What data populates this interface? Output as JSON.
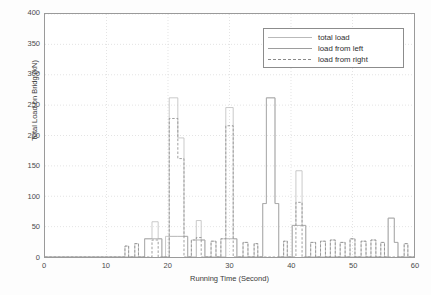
{
  "chart_data": {
    "type": "line",
    "title": "",
    "xlabel": "Running Time (Second)",
    "ylabel": "Total Load on Bridg (kN)",
    "xlim": [
      0,
      60
    ],
    "ylim": [
      0,
      400
    ],
    "xticks": [
      0,
      10,
      20,
      30,
      40,
      50,
      60
    ],
    "yticks": [
      0,
      50,
      100,
      150,
      200,
      250,
      300,
      350,
      400
    ],
    "grid": true,
    "legend_position": "upper-right",
    "legend": [
      {
        "label": "total load",
        "style": "solid",
        "color": "#b9b9b9"
      },
      {
        "label": "load from left",
        "style": "solid",
        "color": "#9d9d9d"
      },
      {
        "label": "load from right",
        "style": "dashed",
        "color": "#8a8a8a"
      }
    ],
    "series": [
      {
        "name": "total load",
        "style": "solid",
        "color": "#c0c0c0",
        "points": [
          [
            0,
            0
          ],
          [
            13.0,
            0
          ],
          [
            13.0,
            18
          ],
          [
            13.6,
            18
          ],
          [
            13.6,
            0
          ],
          [
            14.6,
            0
          ],
          [
            14.6,
            22
          ],
          [
            15.2,
            22
          ],
          [
            15.2,
            0
          ],
          [
            16.2,
            0
          ],
          [
            16.2,
            30
          ],
          [
            17.4,
            30
          ],
          [
            17.4,
            58
          ],
          [
            18.4,
            58
          ],
          [
            18.4,
            30
          ],
          [
            19.0,
            30
          ],
          [
            19.0,
            0
          ],
          [
            19.6,
            0
          ],
          [
            19.6,
            34
          ],
          [
            20.2,
            34
          ],
          [
            20.2,
            262
          ],
          [
            21.6,
            262
          ],
          [
            21.6,
            196
          ],
          [
            22.6,
            196
          ],
          [
            22.6,
            34
          ],
          [
            23.2,
            34
          ],
          [
            23.2,
            0
          ],
          [
            23.8,
            0
          ],
          [
            23.8,
            28
          ],
          [
            24.6,
            28
          ],
          [
            24.6,
            60
          ],
          [
            25.4,
            60
          ],
          [
            25.4,
            28
          ],
          [
            26.0,
            28
          ],
          [
            26.0,
            0
          ],
          [
            27.0,
            0
          ],
          [
            27.0,
            26
          ],
          [
            27.8,
            26
          ],
          [
            27.8,
            0
          ],
          [
            28.6,
            0
          ],
          [
            28.6,
            30
          ],
          [
            29.4,
            30
          ],
          [
            29.4,
            246
          ],
          [
            30.6,
            246
          ],
          [
            30.6,
            30
          ],
          [
            31.2,
            30
          ],
          [
            31.2,
            0
          ],
          [
            32.2,
            0
          ],
          [
            32.2,
            24
          ],
          [
            33.0,
            24
          ],
          [
            33.0,
            0
          ],
          [
            34.0,
            0
          ],
          [
            34.0,
            22
          ],
          [
            34.6,
            22
          ],
          [
            34.6,
            0
          ],
          [
            35.4,
            0
          ],
          [
            35.4,
            88
          ],
          [
            36.0,
            88
          ],
          [
            36.0,
            262
          ],
          [
            37.4,
            262
          ],
          [
            37.4,
            88
          ],
          [
            38.0,
            88
          ],
          [
            38.0,
            0
          ],
          [
            38.8,
            0
          ],
          [
            38.8,
            26
          ],
          [
            39.4,
            26
          ],
          [
            39.4,
            0
          ],
          [
            40.2,
            0
          ],
          [
            40.2,
            52
          ],
          [
            40.8,
            52
          ],
          [
            40.8,
            142
          ],
          [
            41.8,
            142
          ],
          [
            41.8,
            52
          ],
          [
            42.4,
            52
          ],
          [
            42.4,
            0
          ],
          [
            43.2,
            0
          ],
          [
            43.2,
            24
          ],
          [
            44.0,
            24
          ],
          [
            44.0,
            0
          ],
          [
            44.8,
            0
          ],
          [
            44.8,
            26
          ],
          [
            45.6,
            26
          ],
          [
            45.6,
            0
          ],
          [
            46.4,
            0
          ],
          [
            46.4,
            28
          ],
          [
            47.2,
            28
          ],
          [
            47.2,
            0
          ],
          [
            48.0,
            0
          ],
          [
            48.0,
            24
          ],
          [
            48.8,
            24
          ],
          [
            48.8,
            0
          ],
          [
            49.6,
            0
          ],
          [
            49.6,
            30
          ],
          [
            50.4,
            30
          ],
          [
            50.4,
            0
          ],
          [
            51.4,
            0
          ],
          [
            51.4,
            26
          ],
          [
            52.2,
            26
          ],
          [
            52.2,
            0
          ],
          [
            53.0,
            0
          ],
          [
            53.0,
            28
          ],
          [
            53.8,
            28
          ],
          [
            53.8,
            0
          ],
          [
            54.6,
            0
          ],
          [
            54.6,
            24
          ],
          [
            55.2,
            24
          ],
          [
            55.2,
            0
          ],
          [
            55.8,
            0
          ],
          [
            55.8,
            64
          ],
          [
            56.8,
            64
          ],
          [
            56.8,
            24
          ],
          [
            57.4,
            24
          ],
          [
            57.4,
            0
          ],
          [
            58.4,
            0
          ],
          [
            58.4,
            22
          ],
          [
            59.0,
            22
          ],
          [
            59.0,
            0
          ],
          [
            60,
            0
          ]
        ]
      },
      {
        "name": "load from left",
        "style": "solid",
        "color": "#a8a8a8",
        "points": [
          [
            0,
            0
          ],
          [
            16.2,
            0
          ],
          [
            16.2,
            30
          ],
          [
            17.4,
            30
          ],
          [
            17.4,
            30
          ],
          [
            18.4,
            30
          ],
          [
            18.4,
            30
          ],
          [
            19.0,
            30
          ],
          [
            19.0,
            0
          ],
          [
            20.2,
            0
          ],
          [
            20.2,
            34
          ],
          [
            21.6,
            34
          ],
          [
            21.6,
            34
          ],
          [
            22.6,
            34
          ],
          [
            22.6,
            34
          ],
          [
            23.2,
            34
          ],
          [
            23.2,
            0
          ],
          [
            24.6,
            0
          ],
          [
            24.6,
            28
          ],
          [
            25.4,
            28
          ],
          [
            25.4,
            28
          ],
          [
            26.0,
            28
          ],
          [
            26.0,
            0
          ],
          [
            29.4,
            0
          ],
          [
            29.4,
            30
          ],
          [
            30.6,
            30
          ],
          [
            30.6,
            30
          ],
          [
            31.2,
            30
          ],
          [
            31.2,
            0
          ],
          [
            35.4,
            0
          ],
          [
            35.4,
            88
          ],
          [
            36.0,
            88
          ],
          [
            36.0,
            262
          ],
          [
            37.4,
            262
          ],
          [
            37.4,
            88
          ],
          [
            38.0,
            88
          ],
          [
            38.0,
            0
          ],
          [
            40.2,
            0
          ],
          [
            40.2,
            52
          ],
          [
            40.8,
            52
          ],
          [
            40.8,
            52
          ],
          [
            41.8,
            52
          ],
          [
            41.8,
            52
          ],
          [
            42.4,
            52
          ],
          [
            42.4,
            0
          ],
          [
            55.8,
            0
          ],
          [
            55.8,
            64
          ],
          [
            56.8,
            64
          ],
          [
            56.8,
            24
          ],
          [
            57.4,
            24
          ],
          [
            57.4,
            0
          ],
          [
            60,
            0
          ]
        ]
      },
      {
        "name": "load from right",
        "style": "dashed",
        "color": "#8f8f8f",
        "points": [
          [
            0,
            0
          ],
          [
            13.0,
            0
          ],
          [
            13.0,
            18
          ],
          [
            13.6,
            18
          ],
          [
            13.6,
            0
          ],
          [
            14.6,
            0
          ],
          [
            14.6,
            22
          ],
          [
            15.2,
            22
          ],
          [
            15.2,
            0
          ],
          [
            17.4,
            0
          ],
          [
            17.4,
            28
          ],
          [
            18.4,
            28
          ],
          [
            18.4,
            0
          ],
          [
            20.2,
            0
          ],
          [
            20.2,
            228
          ],
          [
            21.6,
            228
          ],
          [
            21.6,
            162
          ],
          [
            22.6,
            162
          ],
          [
            22.6,
            0
          ],
          [
            23.8,
            0
          ],
          [
            23.8,
            28
          ],
          [
            24.6,
            28
          ],
          [
            24.6,
            32
          ],
          [
            25.4,
            32
          ],
          [
            25.4,
            0
          ],
          [
            27.0,
            0
          ],
          [
            27.0,
            26
          ],
          [
            27.8,
            26
          ],
          [
            27.8,
            0
          ],
          [
            28.6,
            0
          ],
          [
            28.6,
            30
          ],
          [
            29.4,
            30
          ],
          [
            29.4,
            216
          ],
          [
            30.6,
            216
          ],
          [
            30.6,
            0
          ],
          [
            32.2,
            0
          ],
          [
            32.2,
            24
          ],
          [
            33.0,
            24
          ],
          [
            33.0,
            0
          ],
          [
            34.0,
            0
          ],
          [
            34.0,
            22
          ],
          [
            34.6,
            22
          ],
          [
            34.6,
            0
          ],
          [
            38.8,
            0
          ],
          [
            38.8,
            26
          ],
          [
            39.4,
            26
          ],
          [
            39.4,
            0
          ],
          [
            40.8,
            0
          ],
          [
            40.8,
            90
          ],
          [
            41.8,
            90
          ],
          [
            41.8,
            0
          ],
          [
            43.2,
            0
          ],
          [
            43.2,
            24
          ],
          [
            44.0,
            24
          ],
          [
            44.0,
            0
          ],
          [
            44.8,
            0
          ],
          [
            44.8,
            26
          ],
          [
            45.6,
            26
          ],
          [
            45.6,
            0
          ],
          [
            46.4,
            0
          ],
          [
            46.4,
            28
          ],
          [
            47.2,
            28
          ],
          [
            47.2,
            0
          ],
          [
            48.0,
            0
          ],
          [
            48.0,
            24
          ],
          [
            48.8,
            24
          ],
          [
            48.8,
            0
          ],
          [
            49.6,
            0
          ],
          [
            49.6,
            30
          ],
          [
            50.4,
            30
          ],
          [
            50.4,
            0
          ],
          [
            51.4,
            0
          ],
          [
            51.4,
            26
          ],
          [
            52.2,
            26
          ],
          [
            52.2,
            0
          ],
          [
            53.0,
            0
          ],
          [
            53.0,
            28
          ],
          [
            53.8,
            28
          ],
          [
            53.8,
            0
          ],
          [
            54.6,
            0
          ],
          [
            54.6,
            24
          ],
          [
            55.2,
            24
          ],
          [
            55.2,
            0
          ],
          [
            58.4,
            0
          ],
          [
            58.4,
            22
          ],
          [
            59.0,
            22
          ],
          [
            59.0,
            0
          ],
          [
            60,
            0
          ]
        ]
      }
    ]
  }
}
